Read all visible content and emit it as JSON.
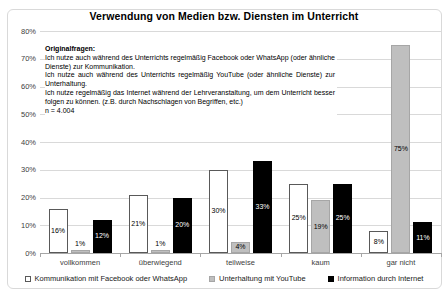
{
  "chart_data": {
    "type": "bar",
    "title": "Verwendung von Medien bzw. Diensten im Unterricht",
    "categories": [
      "vollkommen",
      "überwiegend",
      "teilweise",
      "kaum",
      "gar nicht"
    ],
    "series": [
      {
        "name": "Kommunikation mit Facebook oder WhatsApp",
        "values": [
          16,
          21,
          30,
          25,
          8
        ],
        "fill": "#ffffff",
        "border": "#595959",
        "label_color": "#000000"
      },
      {
        "name": "Unterhaltung mit YouTube",
        "values": [
          1,
          1,
          4,
          19,
          75
        ],
        "fill": "#bfbfbf",
        "border": "#a6a6a6",
        "label_color": "#000000"
      },
      {
        "name": "Information durch Internet",
        "values": [
          12,
          20,
          33,
          25,
          11
        ],
        "fill": "#000000",
        "border": "#000000",
        "label_color": "#ffffff"
      }
    ],
    "ylim": [
      0,
      80
    ],
    "ytick_step": 10,
    "ytick_suffix": "%",
    "data_label_suffix": "%",
    "grid": true,
    "legend_position": "bottom",
    "xlabel": "",
    "ylabel": ""
  },
  "annotation": {
    "heading": "Originalfragen:",
    "questions": [
      "Ich nutze auch während des Unterrichts regelmäßig Facebook oder WhatsApp (oder ähnliche Dienste) zur Kommunikation.",
      "Ich nutze auch während des Unterrichts regelmäßig YouTube (oder ähnliche Dienste) zur Unterhaltung.",
      "Ich nutze regelmäßig das Internet während der Lehrveranstaltung, um dem Unterricht besser folgen zu können. (z.B. durch Nachschlagen von Begriffen, etc.)"
    ],
    "sample": "n = 4.004"
  },
  "colors": {
    "gridline": "#d9d9d9",
    "axis_line": "#a6a6a6",
    "frame_border": "#d9d9d9",
    "tick_label": "#404040",
    "title": "#000000"
  }
}
